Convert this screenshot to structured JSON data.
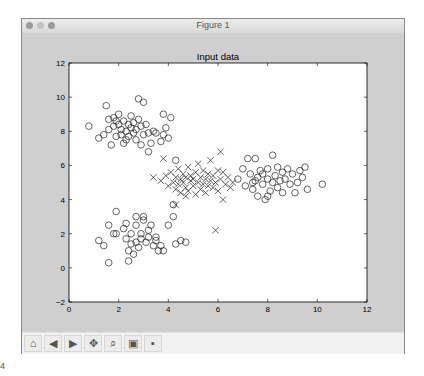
{
  "window": {
    "title": "Figure 1"
  },
  "toolbar": {
    "buttons": [
      {
        "name": "home",
        "glyph": "⌂"
      },
      {
        "name": "back",
        "glyph": "◀"
      },
      {
        "name": "forward",
        "glyph": "▶"
      },
      {
        "name": "pan",
        "glyph": "✥"
      },
      {
        "name": "zoom",
        "glyph": "⌕"
      },
      {
        "name": "configure-subplots",
        "glyph": "▣"
      },
      {
        "name": "save",
        "glyph": "▪"
      }
    ]
  },
  "corner_text": "4",
  "chart_data": {
    "type": "scatter",
    "title": "Input data",
    "xlabel": "",
    "ylabel": "",
    "xlim": [
      0,
      12
    ],
    "ylim": [
      -2,
      12
    ],
    "xticks": [
      "0",
      "2",
      "4",
      "6",
      "8",
      "10",
      "12"
    ],
    "yticks": [
      "-2",
      "0",
      "2",
      "4",
      "6",
      "8",
      "10",
      "12"
    ],
    "grid": false,
    "legend": null,
    "series": [
      {
        "name": "cluster-top-left",
        "marker": "o",
        "center": [
          2.3,
          8.2
        ],
        "points": [
          [
            0.8,
            8.3
          ],
          [
            1.2,
            7.6
          ],
          [
            1.4,
            7.8
          ],
          [
            1.5,
            9.5
          ],
          [
            1.6,
            8.7
          ],
          [
            1.6,
            8.1
          ],
          [
            1.7,
            7.2
          ],
          [
            1.8,
            8.8
          ],
          [
            1.8,
            8.3
          ],
          [
            1.9,
            7.7
          ],
          [
            2.0,
            9.0
          ],
          [
            2.0,
            8.4
          ],
          [
            2.1,
            7.8
          ],
          [
            2.1,
            8.1
          ],
          [
            2.2,
            7.3
          ],
          [
            2.2,
            8.6
          ],
          [
            2.3,
            8.0
          ],
          [
            2.4,
            8.4
          ],
          [
            2.4,
            7.7
          ],
          [
            2.5,
            8.2
          ],
          [
            2.5,
            8.9
          ],
          [
            2.6,
            7.9
          ],
          [
            2.6,
            8.5
          ],
          [
            2.7,
            7.5
          ],
          [
            2.7,
            8.1
          ],
          [
            2.8,
            9.9
          ],
          [
            2.8,
            8.7
          ],
          [
            2.9,
            7.2
          ],
          [
            2.9,
            8.3
          ],
          [
            3.0,
            9.7
          ],
          [
            3.0,
            7.8
          ],
          [
            3.1,
            8.4
          ],
          [
            3.2,
            6.8
          ],
          [
            3.2,
            7.9
          ],
          [
            3.3,
            7.3
          ],
          [
            3.4,
            8.0
          ],
          [
            3.5,
            7.9
          ],
          [
            3.7,
            7.4
          ],
          [
            3.8,
            9.0
          ],
          [
            3.8,
            7.8
          ],
          [
            3.9,
            8.2
          ],
          [
            4.0,
            7.6
          ],
          [
            4.1,
            8.8
          ],
          [
            4.3,
            6.3
          ],
          [
            1.9,
            8.6
          ],
          [
            2.3,
            7.5
          ]
        ]
      },
      {
        "name": "cluster-bottom-left",
        "marker": "o",
        "center": [
          2.8,
          1.8
        ],
        "points": [
          [
            1.2,
            1.6
          ],
          [
            1.4,
            1.3
          ],
          [
            1.6,
            0.3
          ],
          [
            1.6,
            2.5
          ],
          [
            1.8,
            2.0
          ],
          [
            1.9,
            2.0
          ],
          [
            1.9,
            3.3
          ],
          [
            2.2,
            2.3
          ],
          [
            2.3,
            2.6
          ],
          [
            2.3,
            1.7
          ],
          [
            2.4,
            1.0
          ],
          [
            2.4,
            0.4
          ],
          [
            2.5,
            1.4
          ],
          [
            2.5,
            2.0
          ],
          [
            2.6,
            0.8
          ],
          [
            2.7,
            2.5
          ],
          [
            2.7,
            1.5
          ],
          [
            2.7,
            3.0
          ],
          [
            2.8,
            1.2
          ],
          [
            2.9,
            1.7
          ],
          [
            2.9,
            2.0
          ],
          [
            3.0,
            2.8
          ],
          [
            3.0,
            3.0
          ],
          [
            3.1,
            1.5
          ],
          [
            3.2,
            1.8
          ],
          [
            3.2,
            2.2
          ],
          [
            3.3,
            2.5
          ],
          [
            3.4,
            1.3
          ],
          [
            3.5,
            1.6
          ],
          [
            3.5,
            1.8
          ],
          [
            3.6,
            1.0
          ],
          [
            3.7,
            1.3
          ],
          [
            3.8,
            1.0
          ],
          [
            4.0,
            2.5
          ],
          [
            4.2,
            3.7
          ],
          [
            4.2,
            3.0
          ],
          [
            4.3,
            1.4
          ],
          [
            4.5,
            1.6
          ],
          [
            4.7,
            1.5
          ]
        ]
      },
      {
        "name": "cluster-right",
        "marker": "o",
        "center": [
          8.2,
          5.2
        ],
        "points": [
          [
            6.8,
            5.2
          ],
          [
            7.0,
            5.8
          ],
          [
            7.1,
            4.8
          ],
          [
            7.2,
            6.4
          ],
          [
            7.3,
            5.5
          ],
          [
            7.4,
            4.6
          ],
          [
            7.4,
            5.0
          ],
          [
            7.5,
            6.4
          ],
          [
            7.6,
            5.3
          ],
          [
            7.6,
            4.2
          ],
          [
            7.7,
            5.7
          ],
          [
            7.8,
            4.9
          ],
          [
            7.8,
            5.5
          ],
          [
            7.9,
            4.0
          ],
          [
            8.0,
            5.2
          ],
          [
            8.0,
            5.8
          ],
          [
            8.1,
            4.5
          ],
          [
            8.2,
            5.0
          ],
          [
            8.2,
            6.6
          ],
          [
            8.3,
            5.4
          ],
          [
            8.4,
            4.7
          ],
          [
            8.4,
            5.9
          ],
          [
            8.5,
            5.1
          ],
          [
            8.6,
            4.4
          ],
          [
            8.6,
            5.6
          ],
          [
            8.7,
            5.2
          ],
          [
            8.8,
            5.8
          ],
          [
            8.9,
            4.9
          ],
          [
            9.0,
            5.5
          ],
          [
            9.1,
            4.4
          ],
          [
            9.2,
            5.0
          ],
          [
            9.3,
            5.7
          ],
          [
            9.4,
            5.3
          ],
          [
            9.5,
            5.9
          ],
          [
            9.6,
            4.6
          ],
          [
            10.2,
            4.9
          ],
          [
            8.0,
            4.2
          ],
          [
            7.5,
            5.1
          ]
        ]
      },
      {
        "name": "cluster-center",
        "marker": "x",
        "center": [
          5.0,
          5.1
        ],
        "points": [
          [
            3.4,
            5.3
          ],
          [
            3.7,
            5.1
          ],
          [
            3.8,
            6.4
          ],
          [
            3.9,
            5.4
          ],
          [
            4.0,
            4.8
          ],
          [
            4.1,
            5.6
          ],
          [
            4.2,
            5.0
          ],
          [
            4.3,
            4.6
          ],
          [
            4.3,
            5.3
          ],
          [
            4.4,
            5.8
          ],
          [
            4.4,
            4.9
          ],
          [
            4.5,
            5.2
          ],
          [
            4.5,
            4.4
          ],
          [
            4.6,
            5.5
          ],
          [
            4.6,
            5.0
          ],
          [
            4.7,
            4.7
          ],
          [
            4.7,
            5.3
          ],
          [
            4.8,
            5.9
          ],
          [
            4.8,
            4.5
          ],
          [
            4.9,
            5.1
          ],
          [
            4.9,
            5.4
          ],
          [
            5.0,
            4.8
          ],
          [
            5.0,
            5.2
          ],
          [
            5.1,
            5.6
          ],
          [
            5.1,
            4.3
          ],
          [
            5.2,
            5.0
          ],
          [
            5.2,
            6.1
          ],
          [
            5.3,
            4.6
          ],
          [
            5.3,
            5.3
          ],
          [
            5.4,
            5.7
          ],
          [
            5.4,
            4.9
          ],
          [
            5.5,
            5.2
          ],
          [
            5.5,
            4.4
          ],
          [
            5.6,
            5.5
          ],
          [
            5.6,
            4.8
          ],
          [
            5.7,
            5.1
          ],
          [
            5.7,
            6.3
          ],
          [
            5.8,
            4.7
          ],
          [
            5.8,
            5.4
          ],
          [
            5.9,
            5.0
          ],
          [
            6.0,
            5.7
          ],
          [
            6.0,
            4.5
          ],
          [
            6.1,
            5.2
          ],
          [
            6.2,
            5.6
          ],
          [
            6.3,
            4.9
          ],
          [
            6.4,
            5.3
          ],
          [
            6.5,
            4.7
          ],
          [
            6.6,
            5.0
          ],
          [
            6.2,
            4.0
          ],
          [
            5.9,
            2.2
          ],
          [
            4.3,
            3.7
          ],
          [
            4.7,
            4.2
          ],
          [
            6.1,
            6.8
          ]
        ]
      }
    ]
  }
}
